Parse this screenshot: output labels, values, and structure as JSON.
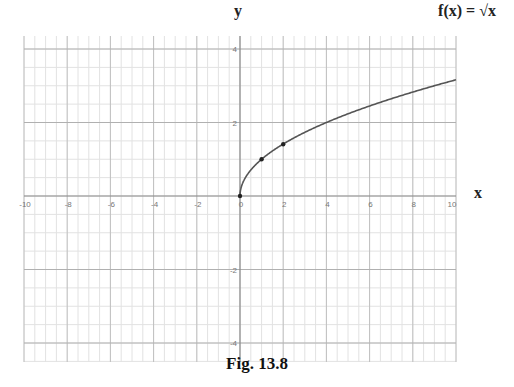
{
  "labels": {
    "y_axis": "y",
    "x_axis": "x",
    "function": "f(x) = √x",
    "caption": "Fig. 13.8"
  },
  "colors": {
    "curve": "#555555",
    "axis": "#888888",
    "major_grid": "#b0b0b0",
    "minor_grid": "#e2e2e2",
    "point": "#222222"
  },
  "chart_data": {
    "type": "line",
    "title": "f(x) = √x",
    "caption": "Fig. 13.8",
    "xlabel": "x",
    "ylabel": "y",
    "xlim": [
      -10,
      10
    ],
    "ylim": [
      -4.5,
      4.3
    ],
    "grid": true,
    "x_ticks": [
      -10,
      -8,
      -6,
      -4,
      -2,
      0,
      2,
      4,
      6,
      8,
      10
    ],
    "y_ticks": [
      -4,
      -2,
      2,
      4
    ],
    "series": [
      {
        "name": "f(x) = √x",
        "x": [
          0,
          0.25,
          0.5,
          1,
          2,
          3,
          4,
          5,
          6,
          7,
          8,
          9,
          10
        ],
        "y": [
          0,
          0.5,
          0.71,
          1,
          1.41,
          1.73,
          2,
          2.24,
          2.45,
          2.65,
          2.83,
          3,
          3.16
        ]
      }
    ],
    "marked_points": [
      {
        "x": 0,
        "y": 0
      },
      {
        "x": 1,
        "y": 1
      },
      {
        "x": 2,
        "y": 1.41
      }
    ]
  }
}
